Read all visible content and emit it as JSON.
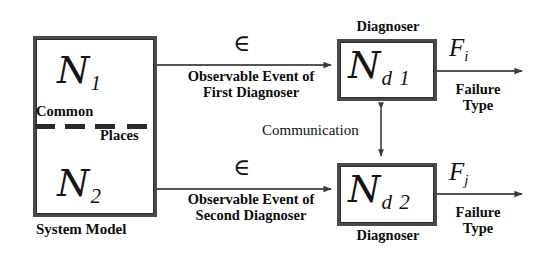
{
  "diagram": {
    "system_model": {
      "box_label_top": "N",
      "n1": "N",
      "n1_sub": "1",
      "n2": "N",
      "n2_sub": "2",
      "common_label": "Common",
      "places_label": "Places",
      "caption": "System Model"
    },
    "diagnosers": [
      {
        "title": "Diagnoser",
        "symbol": "N",
        "symbol_sub": "d 1",
        "input_symbol": "∈",
        "input_label_line1": "Observable Event of",
        "input_label_line2": "First Diagnoser",
        "output_symbol": "F",
        "output_symbol_sub": "i",
        "output_label_line1": "Failure",
        "output_label_line2": "Type"
      },
      {
        "title": "Diagnoser",
        "symbol": "N",
        "symbol_sub": "d 2",
        "input_symbol": "∈",
        "input_label_line1": "Observable Event of",
        "input_label_line2": "Second Diagnoser",
        "output_symbol": "F",
        "output_symbol_sub": "j",
        "output_label_line1": "Failure",
        "output_label_line2": "Type"
      }
    ],
    "communication_label": "Communication",
    "colors": {
      "stroke": "#4a4a4a",
      "ink": "#111111",
      "background": "#ffffff",
      "dashed_divider": "#2b2b2b"
    }
  }
}
